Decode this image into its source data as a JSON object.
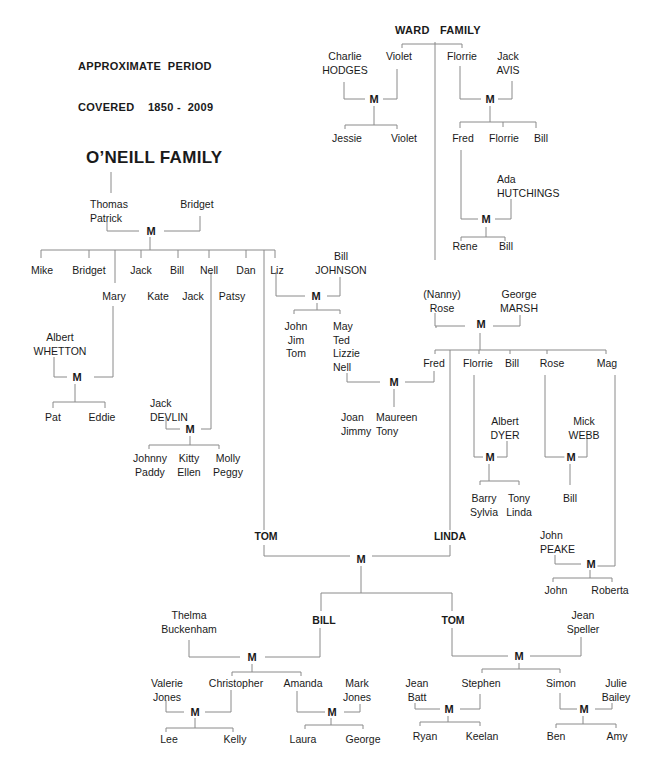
{
  "header": {
    "period_line1": "APPROXIMATE  PERIOD",
    "period_line2": "COVERED    1850 -  2009"
  },
  "families": {
    "oneill": "O’NEILL  FAMILY",
    "ward": "WARD   FAMILY"
  },
  "marriage_symbol": "M",
  "oneill": {
    "father": "Thomas\nPatrick",
    "mother": "Bridget",
    "children_row1": [
      "Mike",
      "Bridget",
      "Jack",
      "Bill",
      "Nell",
      "Dan",
      "Liz"
    ],
    "children_row2": [
      "Mary",
      "Kate",
      "Jack",
      "Patsy"
    ],
    "mary_spouse": "Albert\nWHETTON",
    "mary_children": [
      "Pat",
      "Eddie"
    ],
    "nell_spouse": "Jack\nDEVLIN",
    "nell_children": [
      "Johnny\nPaddy",
      "Kitty\nEllen",
      "Molly\nPeggy"
    ],
    "liz_spouse": "Bill\nJOHNSON",
    "liz_children": [
      "John\nJim\nTom",
      "May\nTed\nLizzie\nNell"
    ],
    "tom": "TOM"
  },
  "ward": {
    "children": [
      "Violet",
      "Florrie"
    ],
    "violet_spouse": "Charlie\nHODGES",
    "violet_children": [
      "Jessie",
      "Violet"
    ],
    "florrie_spouse": "Jack\nAVIS",
    "florrie_children": [
      "Fred",
      "Florrie",
      "Bill"
    ],
    "fred_spouse": "Ada\nHUTCHINGS",
    "fred_children": [
      "Rene",
      "Bill"
    ],
    "rose": "(Nanny)\nRose"
  },
  "marsh": {
    "george": "George\nMARSH",
    "children": [
      "Fred",
      "Florrie",
      "Bill",
      "Rose",
      "Mag"
    ],
    "fred_children": [
      "Joan\nJimmy",
      "Maureen\nTony"
    ],
    "florrie_spouse": "Albert\nDYER",
    "florrie_children": [
      "Barry\nSylvia",
      "Tony\nLinda"
    ],
    "rose_spouse": "Mick\nWEBB",
    "rose_children": [
      "Bill"
    ],
    "mag_spouse": "John\nPEAKE",
    "mag_children": [
      "John",
      "Roberta"
    ],
    "linda": "LINDA"
  },
  "tom_linda": {
    "children": [
      "BILL",
      "TOM"
    ],
    "bill_spouse": "Thelma\nBuckenham",
    "bill_children": [
      "Christopher",
      "Amanda"
    ],
    "christopher_spouse": "Valerie\nJones",
    "christopher_children": [
      "Lee",
      "Kelly"
    ],
    "amanda_spouse": "Mark\nJones",
    "amanda_children": [
      "Laura",
      "George"
    ],
    "tom_spouse": "Jean\nSpeller",
    "tom_children": [
      "Stephen",
      "Simon"
    ],
    "stephen_spouse": "Jean\nBatt",
    "stephen_children": [
      "Ryan",
      "Keelan"
    ],
    "simon_spouse": "Julie\nBailey",
    "simon_children": [
      "Ben",
      "Amy"
    ]
  }
}
